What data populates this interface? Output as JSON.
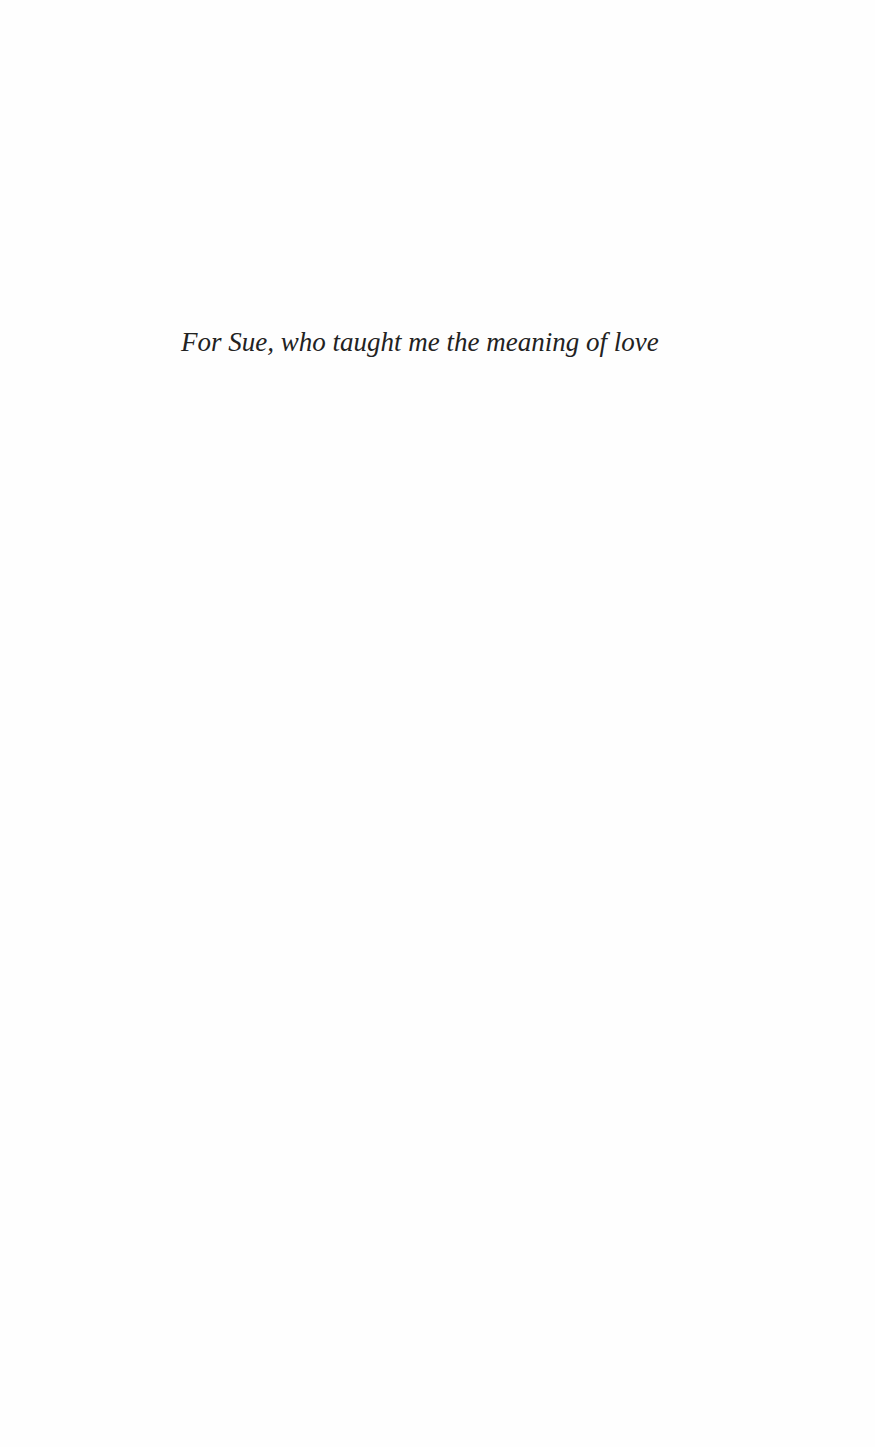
{
  "page": {
    "dedication": "For Sue, who taught me the meaning of love"
  }
}
